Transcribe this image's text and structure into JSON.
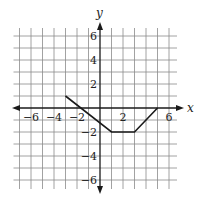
{
  "figure": {
    "type": "coordinate-plane-graph",
    "x_axis_label": "x",
    "y_axis_label": "y",
    "x_range": [
      -7,
      6
    ],
    "y_range": [
      -6,
      6
    ],
    "grid_step": 1,
    "x_tick_labels": [
      {
        "value": -6,
        "text": "−6"
      },
      {
        "value": -4,
        "text": "−4"
      },
      {
        "value": -2,
        "text": "−2"
      },
      {
        "value": 2,
        "text": "2"
      },
      {
        "value": 6,
        "text": "6"
      }
    ],
    "y_tick_labels": [
      {
        "value": 6,
        "text": "6"
      },
      {
        "value": 4,
        "text": "4"
      },
      {
        "value": 2,
        "text": "2"
      },
      {
        "value": -2,
        "text": "−2"
      },
      {
        "value": -4,
        "text": "−4"
      },
      {
        "value": -6,
        "text": "−6"
      }
    ],
    "function_vertices": [
      {
        "x": -3,
        "y": 1
      },
      {
        "x": 1,
        "y": -2
      },
      {
        "x": 3,
        "y": -2
      },
      {
        "x": 5,
        "y": 0
      }
    ],
    "colors": {
      "grid": "#8a8a8a",
      "axis": "#1a1a1a",
      "curve": "#1a1a1a",
      "background": "#ffffff"
    }
  }
}
